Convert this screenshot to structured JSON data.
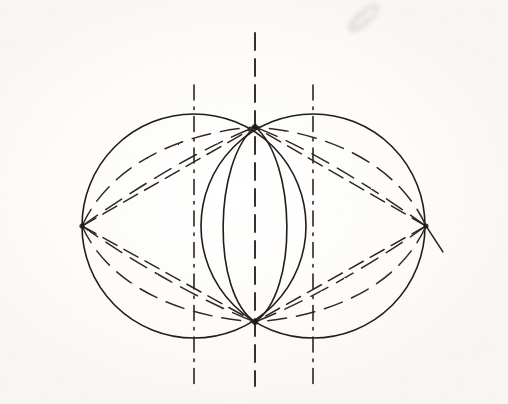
{
  "document": {
    "title": "Vesica Piscis Construction",
    "medium": "pencil on paper",
    "background_color": "#fdfcfa",
    "ink_color": "#25211e",
    "faint_ink_color": "#6b6560"
  },
  "geometry": {
    "units": "pixels",
    "points": {
      "left_vertex": {
        "name": "A",
        "x": 82,
        "y": 226
      },
      "right_vertex": {
        "name": "B",
        "x": 426,
        "y": 226
      },
      "top_vertex": {
        "name": "C",
        "x": 255,
        "y": 127
      },
      "bottom_vertex": {
        "name": "D",
        "x": 255,
        "y": 322
      },
      "left_center": {
        "name": "O1",
        "x": 194,
        "y": 226
      },
      "right_center": {
        "name": "O2",
        "x": 313,
        "y": 226
      }
    },
    "circles": [
      {
        "name": "left-circle",
        "cx": 194,
        "cy": 226,
        "r": 112,
        "style": "solid"
      },
      {
        "name": "right-circle",
        "cx": 313,
        "cy": 226,
        "r": 112,
        "style": "solid"
      }
    ],
    "vesica": {
      "name": "vesica-piscis-lens",
      "top": {
        "x": 255,
        "y": 127
      },
      "bottom": {
        "x": 255,
        "y": 322
      },
      "half_width": 59,
      "style": "solid"
    },
    "axis": {
      "name": "horizontal-axis",
      "x1": 22,
      "y1": 226,
      "x2": 486,
      "y2": 226,
      "style": "solid"
    },
    "vertical_construction_lines": [
      {
        "name": "left-vertical",
        "x": 194,
        "y_top": 85,
        "y_bottom": 384,
        "style": "dash-dot"
      },
      {
        "name": "center-vertical",
        "x": 255,
        "y_top": 33,
        "y_bottom": 386,
        "style": "dashed"
      },
      {
        "name": "right-vertical",
        "x": 313,
        "y_top": 85,
        "y_bottom": 384,
        "style": "dash-dot"
      }
    ],
    "chords": {
      "count": 4,
      "description": "straight dashed chords joining the four vertices",
      "segments": [
        {
          "from": "left_vertex",
          "to": "top_vertex",
          "style": "dashed"
        },
        {
          "from": "left_vertex",
          "to": "bottom_vertex",
          "style": "dashed"
        },
        {
          "from": "right_vertex",
          "to": "top_vertex",
          "style": "dashed"
        },
        {
          "from": "right_vertex",
          "to": "bottom_vertex",
          "style": "dashed"
        }
      ]
    },
    "dashed_arcs": {
      "description": "pairs of dashed arcs of differing curvature sweeping between each side vertex and the top/bottom vertices",
      "quadrants": [
        "upper-left",
        "lower-left",
        "upper-right",
        "lower-right"
      ],
      "arcs_per_quadrant": 2
    },
    "tick_mark": {
      "name": "right-vertex-tick",
      "x1": 426,
      "y1": 226,
      "x2": 443,
      "y2": 252,
      "style": "solid"
    },
    "smudge": {
      "name": "pencil-smudge",
      "x": 348,
      "y": 13,
      "width": 34,
      "height": 22,
      "rotation": -42
    }
  }
}
